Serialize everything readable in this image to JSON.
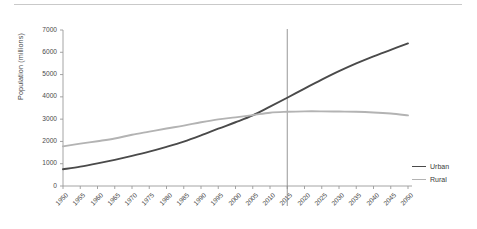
{
  "chart_data": {
    "type": "line",
    "title": "",
    "subtitle": "",
    "xlabel": "",
    "ylabel": "Population (millions)",
    "xlim": [
      1950,
      2050
    ],
    "ylim": [
      0,
      7000
    ],
    "ytick_step": 1000,
    "xtick_step": 5,
    "grid": false,
    "legend_position": "right",
    "x": [
      1950,
      1955,
      1960,
      1965,
      1970,
      1975,
      1980,
      1985,
      1990,
      1995,
      2000,
      2005,
      2010,
      2015,
      2020,
      2025,
      2030,
      2035,
      2040,
      2045,
      2050
    ],
    "xticklabels": [
      "1950",
      "1955",
      "1960",
      "1965",
      "1970",
      "1975",
      "1980",
      "1985",
      "1990",
      "1995",
      "2000",
      "2005",
      "2010",
      "2015",
      "2020",
      "2025",
      "2030",
      "2035",
      "2040",
      "2045",
      "2050"
    ],
    "yticklabels": [
      "0",
      "1000",
      "2000",
      "3000",
      "4000",
      "5000",
      "6000",
      "7000"
    ],
    "series": [
      {
        "name": "Urban",
        "color": "#4a4a4a",
        "values": [
          750,
          870,
          1015,
          1175,
          1350,
          1540,
          1755,
          1990,
          2270,
          2570,
          2860,
          3170,
          3560,
          3960,
          4370,
          4770,
          5150,
          5500,
          5820,
          6110,
          6400
        ]
      },
      {
        "name": "Rural",
        "color": "#b3b3b3",
        "values": [
          1780,
          1900,
          2010,
          2130,
          2300,
          2440,
          2580,
          2710,
          2860,
          2990,
          3080,
          3180,
          3290,
          3330,
          3350,
          3350,
          3340,
          3330,
          3300,
          3250,
          3170
        ]
      }
    ],
    "annotations": [
      {
        "type": "vertical-line",
        "x": 2015,
        "color": "#8c8c8c",
        "label": ""
      }
    ]
  },
  "legend": {
    "items": [
      {
        "label": "Urban",
        "color": "#4a4a4a"
      },
      {
        "label": "Rural",
        "color": "#b3b3b3"
      }
    ]
  }
}
